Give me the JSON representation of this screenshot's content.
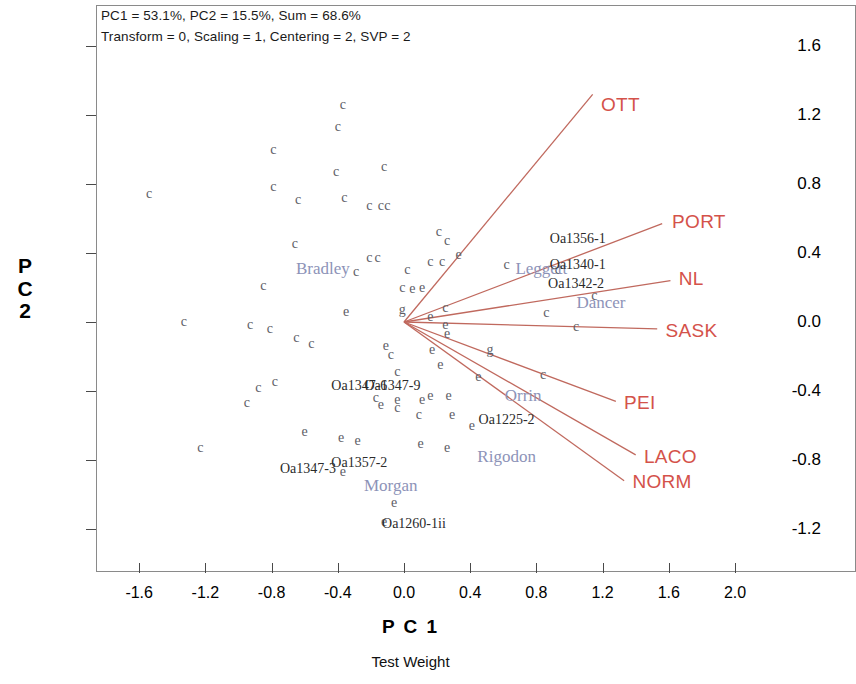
{
  "annotation": {
    "line1": "PC1 = 53.1%, PC2 = 15.5%, Sum = 68.6%",
    "line2": "Transform = 0, Scaling = 1, Centering = 2, SVP = 2"
  },
  "chart_data": {
    "type": "scatter",
    "title": "",
    "subtitle": "Test Weight",
    "xlabel": "P C 1",
    "ylabel": "P C 2",
    "xlim": [
      -1.82,
      2.22
    ],
    "ylim": [
      -1.4,
      1.74
    ],
    "xticks": [
      "-1.6",
      "-1.2",
      "-0.8",
      "-0.4",
      "0.0",
      "0.4",
      "0.8",
      "1.2",
      "1.6",
      "2.0"
    ],
    "xtick_values": [
      -1.6,
      -1.2,
      -0.8,
      -0.4,
      0.0,
      0.4,
      0.8,
      1.2,
      1.6,
      2.0
    ],
    "yticks": [
      "1.6",
      "1.2",
      "0.8",
      "0.4",
      "0.0",
      "-0.4",
      "-0.8",
      "-1.2"
    ],
    "ytick_values": [
      1.6,
      1.2,
      0.8,
      0.4,
      0.0,
      -0.4,
      -0.8,
      -1.2
    ],
    "grid": false,
    "legend": false,
    "variance_explained": {
      "PC1": 53.1,
      "PC2": 15.5,
      "sum": 68.6
    },
    "options": {
      "transform": 0,
      "scaling": 1,
      "centering": 2,
      "svp": 2
    },
    "colors": {
      "vector": "#c0695e",
      "vector_label": "#d4524a",
      "point": "#5d5d66",
      "cultivar_label": "#8d93b8",
      "accession_label": "#2b2b2b",
      "axis": "#4a4a4a",
      "frame": "#8a8a8a"
    },
    "origin": [
      0.0,
      0.0
    ],
    "vectors": [
      {
        "name": "OTT",
        "x": 1.14,
        "y": 1.32,
        "label_x": 1.19,
        "label_y": 1.26
      },
      {
        "name": "PORT",
        "x": 1.56,
        "y": 0.57,
        "label_x": 1.62,
        "label_y": 0.58
      },
      {
        "name": "NL",
        "x": 1.61,
        "y": 0.24,
        "label_x": 1.66,
        "label_y": 0.25
      },
      {
        "name": "SASK",
        "x": 1.53,
        "y": -0.04,
        "label_x": 1.58,
        "label_y": -0.05
      },
      {
        "name": "PEI",
        "x": 1.28,
        "y": -0.46,
        "label_x": 1.33,
        "label_y": -0.47
      },
      {
        "name": "LACO",
        "x": 1.4,
        "y": -0.77,
        "label_x": 1.45,
        "label_y": -0.78
      },
      {
        "name": "NORM",
        "x": 1.33,
        "y": -0.92,
        "label_x": 1.38,
        "label_y": -0.93
      }
    ],
    "cultivar_labels": [
      {
        "text": "Bradley",
        "x": -0.49,
        "y": 0.31
      },
      {
        "text": "Leggett",
        "x": 0.83,
        "y": 0.31
      },
      {
        "text": "Dancer",
        "x": 1.19,
        "y": 0.11
      },
      {
        "text": "Orrin",
        "x": 0.72,
        "y": -0.43
      },
      {
        "text": "Rigodon",
        "x": 0.62,
        "y": -0.78
      },
      {
        "text": "Morgan",
        "x": -0.08,
        "y": -0.95
      }
    ],
    "accession_labels": [
      {
        "text": "Oa1356-1",
        "x": 1.05,
        "y": 0.48
      },
      {
        "text": "Oa1340-1",
        "x": 1.05,
        "y": 0.33
      },
      {
        "text": "Oa1342-2",
        "x": 1.04,
        "y": 0.22
      },
      {
        "text": "Oa1225-2",
        "x": 0.62,
        "y": -0.57
      },
      {
        "text": "Oa1347-6",
        "x": -0.27,
        "y": -0.37
      },
      {
        "text": "Oa1347-9",
        "x": -0.07,
        "y": -0.37
      },
      {
        "text": "Oa1347-3",
        "x": -0.58,
        "y": -0.85
      },
      {
        "text": "Oa1357-2",
        "x": -0.27,
        "y": -0.82
      },
      {
        "text": "Oa1260-1ii",
        "x": 0.06,
        "y": -1.17
      }
    ],
    "points": [
      {
        "glyph": "c",
        "x": -1.54,
        "y": 0.74
      },
      {
        "glyph": "c",
        "x": -0.79,
        "y": 1.0
      },
      {
        "glyph": "c",
        "x": -0.37,
        "y": 1.26
      },
      {
        "glyph": "c",
        "x": -0.4,
        "y": 1.13
      },
      {
        "glyph": "c",
        "x": -0.41,
        "y": 0.87
      },
      {
        "glyph": "c",
        "x": -0.12,
        "y": 0.9
      },
      {
        "glyph": "c",
        "x": -0.79,
        "y": 0.78
      },
      {
        "glyph": "c",
        "x": -0.64,
        "y": 0.71
      },
      {
        "glyph": "c",
        "x": -0.36,
        "y": 0.72
      },
      {
        "glyph": "c",
        "x": -0.21,
        "y": 0.67
      },
      {
        "glyph": "c",
        "x": -0.14,
        "y": 0.67
      },
      {
        "glyph": "c",
        "x": -0.1,
        "y": 0.67
      },
      {
        "glyph": "c",
        "x": -0.66,
        "y": 0.45
      },
      {
        "glyph": "c",
        "x": 0.21,
        "y": 0.52
      },
      {
        "glyph": "c",
        "x": 0.26,
        "y": 0.47
      },
      {
        "glyph": "e",
        "x": 0.33,
        "y": 0.39
      },
      {
        "glyph": "c",
        "x": -0.21,
        "y": 0.37
      },
      {
        "glyph": "c",
        "x": -0.16,
        "y": 0.37
      },
      {
        "glyph": "c",
        "x": 0.16,
        "y": 0.35
      },
      {
        "glyph": "c",
        "x": 0.23,
        "y": 0.35
      },
      {
        "glyph": "c",
        "x": -0.29,
        "y": 0.29
      },
      {
        "glyph": "c",
        "x": 0.02,
        "y": 0.3
      },
      {
        "glyph": "c",
        "x": 0.62,
        "y": 0.33
      },
      {
        "glyph": "c",
        "x": -0.85,
        "y": 0.21
      },
      {
        "glyph": "c",
        "x": -0.01,
        "y": 0.2
      },
      {
        "glyph": "e",
        "x": 0.05,
        "y": 0.19
      },
      {
        "glyph": "e",
        "x": 0.11,
        "y": 0.2
      },
      {
        "glyph": "c",
        "x": 0.93,
        "y": 0.3
      },
      {
        "glyph": "c",
        "x": 1.15,
        "y": 0.15
      },
      {
        "glyph": "e",
        "x": -0.35,
        "y": 0.06
      },
      {
        "glyph": "g",
        "x": -0.01,
        "y": 0.07
      },
      {
        "glyph": "c",
        "x": 0.25,
        "y": 0.08
      },
      {
        "glyph": "e",
        "x": 0.16,
        "y": 0.03
      },
      {
        "glyph": "c",
        "x": 0.86,
        "y": 0.05
      },
      {
        "glyph": "c",
        "x": -1.33,
        "y": 0.0
      },
      {
        "glyph": "e",
        "x": 0.25,
        "y": -0.02
      },
      {
        "glyph": "e",
        "x": 0.26,
        "y": -0.07
      },
      {
        "glyph": "c",
        "x": 1.04,
        "y": -0.03
      },
      {
        "glyph": "c",
        "x": -0.93,
        "y": -0.02
      },
      {
        "glyph": "c",
        "x": -0.81,
        "y": -0.04
      },
      {
        "glyph": "c",
        "x": -0.65,
        "y": -0.09
      },
      {
        "glyph": "c",
        "x": -0.56,
        "y": -0.13
      },
      {
        "glyph": "e",
        "x": -0.11,
        "y": -0.14
      },
      {
        "glyph": "c",
        "x": -0.08,
        "y": -0.19
      },
      {
        "glyph": "e",
        "x": 0.17,
        "y": -0.16
      },
      {
        "glyph": "g",
        "x": 0.52,
        "y": -0.16
      },
      {
        "glyph": "e",
        "x": 0.22,
        "y": -0.25
      },
      {
        "glyph": "c",
        "x": -0.04,
        "y": -0.29
      },
      {
        "glyph": "e",
        "x": 0.45,
        "y": -0.32
      },
      {
        "glyph": "c",
        "x": 0.84,
        "y": -0.31
      },
      {
        "glyph": "c",
        "x": -0.88,
        "y": -0.38
      },
      {
        "glyph": "c",
        "x": -0.78,
        "y": -0.35
      },
      {
        "glyph": "c",
        "x": -0.17,
        "y": -0.44
      },
      {
        "glyph": "e",
        "x": -0.14,
        "y": -0.48
      },
      {
        "glyph": "e",
        "x": -0.04,
        "y": -0.45
      },
      {
        "glyph": "c",
        "x": -0.04,
        "y": -0.5
      },
      {
        "glyph": "e",
        "x": 0.11,
        "y": -0.45
      },
      {
        "glyph": "e",
        "x": 0.16,
        "y": -0.43
      },
      {
        "glyph": "e",
        "x": 0.27,
        "y": -0.43
      },
      {
        "glyph": "c",
        "x": -0.95,
        "y": -0.47
      },
      {
        "glyph": "c",
        "x": 0.09,
        "y": -0.54
      },
      {
        "glyph": "e",
        "x": 0.29,
        "y": -0.54
      },
      {
        "glyph": "e",
        "x": 0.41,
        "y": -0.6
      },
      {
        "glyph": "e",
        "x": -0.6,
        "y": -0.64
      },
      {
        "glyph": "e",
        "x": -0.38,
        "y": -0.67
      },
      {
        "glyph": "e",
        "x": -0.28,
        "y": -0.69
      },
      {
        "glyph": "e",
        "x": 0.1,
        "y": -0.71
      },
      {
        "glyph": "e",
        "x": 0.26,
        "y": -0.73
      },
      {
        "glyph": "c",
        "x": -1.23,
        "y": -0.73
      },
      {
        "glyph": "e",
        "x": -0.37,
        "y": -0.87
      },
      {
        "glyph": "e",
        "x": -0.06,
        "y": -1.05
      },
      {
        "glyph": "e",
        "x": -0.12,
        "y": -1.16
      }
    ]
  }
}
